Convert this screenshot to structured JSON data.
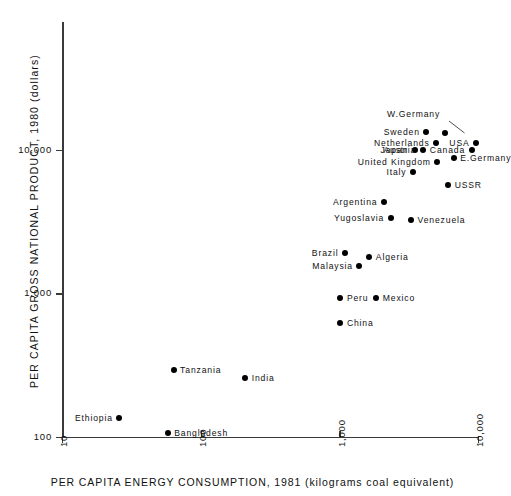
{
  "chart_data": {
    "type": "scatter",
    "title": "",
    "xlabel": "PER CAPITA ENERGY CONSUMPTION, 1981 (kilograms coal equivalent)",
    "ylabel": "PER CAPITA GROSS NATIONAL PRODUCT, 1980  (dollars)",
    "xscale": "log",
    "yscale": "log",
    "xlim": [
      10,
      10000
    ],
    "ylim": [
      100,
      20000
    ],
    "xticks": [
      "10",
      "100",
      "1,000",
      "10,000"
    ],
    "xtick_values": [
      10,
      100,
      1000,
      10000
    ],
    "yticks": [
      "100",
      "1,000",
      "10,000"
    ],
    "ytick_values": [
      100,
      1000,
      10000
    ],
    "grid": false,
    "legend": "none",
    "marker": "filled-circle",
    "marker_color": "#000000",
    "points": [
      {
        "name": "W.Germany",
        "x": 5800,
        "y": 13200,
        "label_side": "leader",
        "label_dx": -58,
        "label_dy": -24
      },
      {
        "name": "Sweden",
        "x": 4250,
        "y": 13400,
        "label_side": "left"
      },
      {
        "name": "Netherlands",
        "x": 5000,
        "y": 11200,
        "label_side": "left"
      },
      {
        "name": "USA",
        "x": 9700,
        "y": 11200,
        "label_side": "left"
      },
      {
        "name": "Austria",
        "x": 4000,
        "y": 10000,
        "label_side": "left"
      },
      {
        "name": "Japan",
        "x": 3500,
        "y": 10000,
        "label_side": "left"
      },
      {
        "name": "Canada",
        "x": 9000,
        "y": 10000,
        "label_side": "left"
      },
      {
        "name": "E.Germany",
        "x": 6700,
        "y": 8700,
        "label_side": "right"
      },
      {
        "name": "United Kingdom",
        "x": 5100,
        "y": 8200,
        "label_side": "left"
      },
      {
        "name": "Italy",
        "x": 3400,
        "y": 7000,
        "label_side": "left"
      },
      {
        "name": "USSR",
        "x": 6100,
        "y": 5700,
        "label_side": "right"
      },
      {
        "name": "Argentina",
        "x": 2100,
        "y": 4300,
        "label_side": "left"
      },
      {
        "name": "Yugoslavia",
        "x": 2350,
        "y": 3350,
        "label_side": "left"
      },
      {
        "name": "Venezuela",
        "x": 3300,
        "y": 3250,
        "label_side": "right"
      },
      {
        "name": "Brazil",
        "x": 1100,
        "y": 1920,
        "label_side": "left"
      },
      {
        "name": "Algeria",
        "x": 1650,
        "y": 1800,
        "label_side": "right"
      },
      {
        "name": "Malaysia",
        "x": 1400,
        "y": 1560,
        "label_side": "left"
      },
      {
        "name": "Peru",
        "x": 1020,
        "y": 930,
        "label_side": "right"
      },
      {
        "name": "Mexico",
        "x": 1850,
        "y": 930,
        "label_side": "right"
      },
      {
        "name": "China",
        "x": 1020,
        "y": 620,
        "label_side": "right"
      },
      {
        "name": "Tanzania",
        "x": 64,
        "y": 290,
        "label_side": "right"
      },
      {
        "name": "India",
        "x": 210,
        "y": 255,
        "label_side": "right"
      },
      {
        "name": "Ethiopia",
        "x": 26,
        "y": 135,
        "label_side": "left"
      },
      {
        "name": "Bangladesh",
        "x": 58,
        "y": 106,
        "label_side": "right"
      }
    ]
  },
  "axes": {
    "y_title": "PER CAPITA GROSS NATIONAL PRODUCT, 1980  (dollars)",
    "x_title": "PER CAPITA ENERGY CONSUMPTION, 1981 (kilograms coal equivalent)",
    "y_tick_labels": [
      "10,000",
      "1,000",
      "100"
    ],
    "x_tick_labels": [
      "10",
      "100",
      "1,000",
      "10,000"
    ]
  }
}
